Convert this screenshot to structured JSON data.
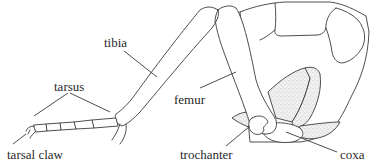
{
  "diagram": {
    "labels": {
      "tibia": "tibia",
      "tarsus": "tarsus",
      "tarsal_claw": "tarsal claw",
      "femur": "femur",
      "trochanter": "trochanter",
      "coxa": "coxa"
    },
    "colors": {
      "line": "#3a3a3a",
      "text": "#2a2a2a",
      "background": "#ffffff",
      "stipple": "#bdbdbd"
    }
  }
}
